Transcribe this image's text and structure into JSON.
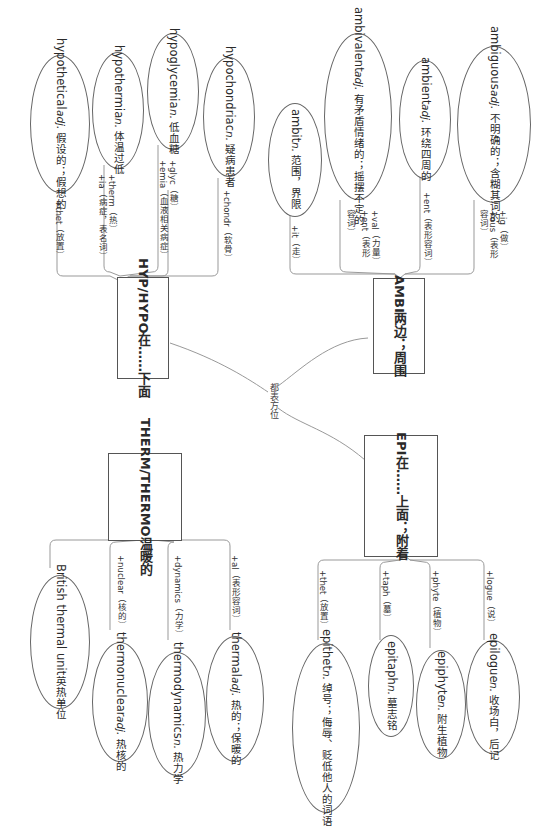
{
  "center": {
    "label": "都表方位"
  },
  "groups": {
    "hypo": {
      "root": {
        "line1": "HYP/HYPO",
        "line2": "在……下面"
      },
      "words": [
        {
          "word": "hypothetical",
          "pos": "adj.",
          "def": "假设的；假想的",
          "affix": "+thet（放置）"
        },
        {
          "word": "hypothermia",
          "pos": "n.",
          "def": "体温过低",
          "affix1": "+therm（热）",
          "affix2": "+ia（病症，表名词）"
        },
        {
          "word": "hypoglycemia",
          "pos": "n.",
          "def": "低血糖",
          "affix1": "+glyc（糖）",
          "affix2": "+emia（血液相关病症）"
        },
        {
          "word": "hypochondriac",
          "pos": "n.",
          "def": "疑病患者",
          "affix": "+chondr（软骨）"
        }
      ]
    },
    "ambi": {
      "root": {
        "line1": "AMBI",
        "line2": "两边；周围"
      },
      "words": [
        {
          "word": "ambit",
          "pos": "n.",
          "def": "范围，界限",
          "affix": "+it（走）"
        },
        {
          "word": "ambivalent",
          "pos": "adj.",
          "def1": "有矛盾情绪的；",
          "def2": "摇摆不定的",
          "affix1": "+val（力量）",
          "affix2": "+ent（表形",
          "affix3": "容词）"
        },
        {
          "word": "ambient",
          "pos": "adj.",
          "def": "环绕四周的",
          "affix": "+ent（表形容词）"
        },
        {
          "word": "ambiguous",
          "pos": "adj.",
          "def1": "不明确的；",
          "def2": "含糊其词的",
          "affix1": "+ig（做）",
          "affix2": "+ous（表形",
          "affix3": "容词）"
        }
      ]
    },
    "therm": {
      "root": {
        "line1": "THERM/",
        "line2": "THERMO",
        "line3": "温暖的"
      },
      "words": [
        {
          "word": "British thermal unit",
          "def": "英热单位"
        },
        {
          "word": "thermonuclear",
          "pos": "adj.",
          "def": "热核的",
          "affix": "+nuclear（核的）"
        },
        {
          "word": "thermodynamics",
          "pos": "n.",
          "def": "热力学",
          "affix": "+dynamics（力学）"
        },
        {
          "word": "thermal",
          "pos": "adj.",
          "def": "热的；保暖的",
          "affix": "+al（表形容词）"
        }
      ]
    },
    "epi": {
      "root": {
        "line1": "EPI",
        "line2": "在……上面；",
        "line3": "附着"
      },
      "words": [
        {
          "word": "epithet",
          "pos": "n.",
          "def1": "绰号；",
          "def2": "侮辱、贬低他人的词语",
          "affix": "+thet（放置）"
        },
        {
          "word": "epitaph",
          "pos": "n.",
          "def": "墓志铭",
          "affix": "+taph（墓）"
        },
        {
          "word": "epiphyte",
          "pos": "n.",
          "def": "附生植物",
          "affix": "+phyte（植物）"
        },
        {
          "word": "epilogue",
          "pos": "n.",
          "def": "收场白，后记",
          "affix": "+logue（说）"
        }
      ]
    }
  },
  "colors": {
    "line": "#888888",
    "border": "#555555",
    "background": "#ffffff"
  }
}
